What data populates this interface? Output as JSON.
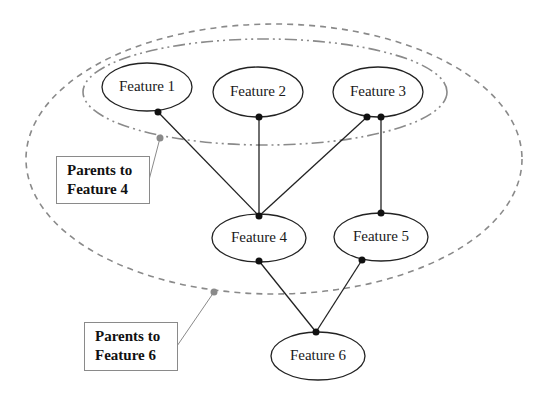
{
  "diagram": {
    "type": "feature-dependency-graph",
    "nodes": [
      {
        "id": "f1",
        "label": "Feature 1",
        "cx": 147,
        "cy": 87,
        "rx": 45,
        "ry": 24
      },
      {
        "id": "f2",
        "label": "Feature 2",
        "cx": 258,
        "cy": 92,
        "rx": 45,
        "ry": 25
      },
      {
        "id": "f3",
        "label": "Feature 3",
        "cx": 378,
        "cy": 92,
        "rx": 45,
        "ry": 25
      },
      {
        "id": "f4",
        "label": "Feature 4",
        "cx": 259,
        "cy": 238,
        "rx": 47,
        "ry": 24
      },
      {
        "id": "f5",
        "label": "Feature 5",
        "cx": 381,
        "cy": 237,
        "rx": 47,
        "ry": 24
      },
      {
        "id": "f6",
        "label": "Feature 6",
        "cx": 318,
        "cy": 356,
        "rx": 47,
        "ry": 24
      }
    ],
    "edges": [
      {
        "from": "Feature 1",
        "to": "Feature 4"
      },
      {
        "from": "Feature 2",
        "to": "Feature 4"
      },
      {
        "from": "Feature 3",
        "to": "Feature 4"
      },
      {
        "from": "Feature 3",
        "to": "Feature 5"
      },
      {
        "from": "Feature 4",
        "to": "Feature 6"
      },
      {
        "from": "Feature 5",
        "to": "Feature 6"
      }
    ],
    "groups": [
      {
        "id": "parents-f4",
        "members": [
          "Feature 1",
          "Feature 2",
          "Feature 3"
        ],
        "style": "dash-dot"
      },
      {
        "id": "parents-f6",
        "members": [
          "Feature 1",
          "Feature 2",
          "Feature 3",
          "Feature 4",
          "Feature 5"
        ],
        "style": "dashed"
      }
    ],
    "callouts": [
      {
        "line1": "Parents to",
        "line2": "Feature 4"
      },
      {
        "line1": "Parents to",
        "line2": "Feature 6"
      }
    ],
    "colors": {
      "node_stroke": "#222222",
      "group_stroke": "#8a8a8a",
      "background": "#ffffff"
    }
  }
}
